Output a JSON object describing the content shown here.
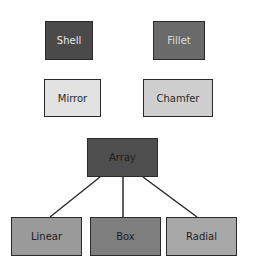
{
  "diagram": {
    "nodes": [
      {
        "id": "shell",
        "label": "Shell",
        "x": 45,
        "y": 21,
        "w": 48,
        "h": 39,
        "fill": "#4a4a4a",
        "text": "#e8e8e8"
      },
      {
        "id": "fillet",
        "label": "Fillet",
        "x": 153,
        "y": 21,
        "w": 52,
        "h": 39,
        "fill": "#6a6a6a",
        "text": "#dcdcdc"
      },
      {
        "id": "mirror",
        "label": "Mirror",
        "x": 44,
        "y": 79,
        "w": 57,
        "h": 38,
        "fill": "#e2e2e2",
        "text": "#2a2a2a"
      },
      {
        "id": "chamfer",
        "label": "Chamfer",
        "x": 143,
        "y": 79,
        "w": 70,
        "h": 38,
        "fill": "#cfcfcf",
        "text": "#2a2a2a"
      },
      {
        "id": "array",
        "label": "Array",
        "x": 87,
        "y": 138,
        "w": 71,
        "h": 39,
        "fill": "#4e4e4e",
        "text": "#1e1e1e"
      },
      {
        "id": "linear",
        "label": "Linear",
        "x": 11,
        "y": 217,
        "w": 71,
        "h": 39,
        "fill": "#9a9a9a",
        "text": "#1e1e1e"
      },
      {
        "id": "box",
        "label": "Box",
        "x": 90,
        "y": 217,
        "w": 71,
        "h": 39,
        "fill": "#7e7e7e",
        "text": "#1e1e1e"
      },
      {
        "id": "radial",
        "label": "Radial",
        "x": 166,
        "y": 217,
        "w": 71,
        "h": 39,
        "fill": "#a8a8a8",
        "text": "#1e1e1e"
      }
    ],
    "edges": [
      {
        "from": "array",
        "to": "linear",
        "x1": 100,
        "y1": 177,
        "x2": 50,
        "y2": 217
      },
      {
        "from": "array",
        "to": "box",
        "x1": 123,
        "y1": 177,
        "x2": 123,
        "y2": 217
      },
      {
        "from": "array",
        "to": "radial",
        "x1": 143,
        "y1": 177,
        "x2": 197,
        "y2": 217
      }
    ],
    "edge_color": "#2a2a2a"
  }
}
